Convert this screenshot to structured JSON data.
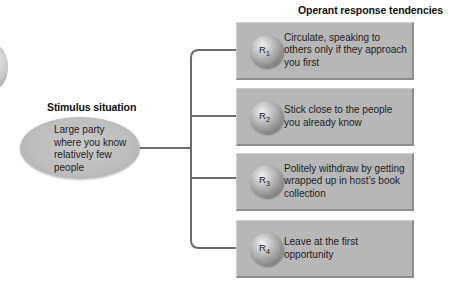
{
  "diagram": {
    "title": "Operant response tendencies",
    "stimulus": {
      "heading": "Stimulus situation",
      "text": "Large party where you know relatively few people"
    },
    "responses": [
      {
        "label": "R",
        "index": "1",
        "text": "Circulate, speaking to others only if they approach you first"
      },
      {
        "label": "R",
        "index": "2",
        "text": "Stick close to the people you already know"
      },
      {
        "label": "R",
        "index": "3",
        "text": "Politely withdraw by getting wrapped up in host’s book collection"
      },
      {
        "label": "R",
        "index": "4",
        "text": "Leave at the first opportunity"
      }
    ],
    "colors": {
      "box_fill": "#b7b7b7",
      "ellipse_fill": "#c2c2c2",
      "connector": "#6b6b6b"
    }
  }
}
